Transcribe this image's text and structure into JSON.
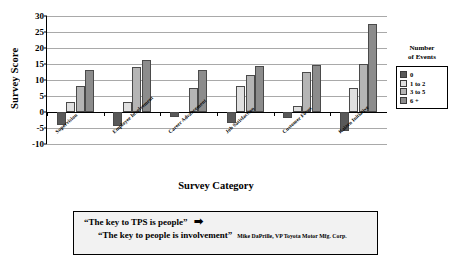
{
  "chart_data": {
    "type": "bar",
    "title": "",
    "xlabel": "Survey Category",
    "ylabel": "Survey Score",
    "ylim": [
      -10,
      30
    ],
    "yticks": [
      -10,
      -5,
      0,
      5,
      10,
      15,
      20,
      25,
      30
    ],
    "grid": true,
    "legend_position": "right",
    "legend_title": "Number of Events",
    "categories": [
      "Supervision",
      "Employee Involvement",
      "Career Advancement",
      "Job Satisfaction",
      "Customer Focus",
      "Kaizen Initiative"
    ],
    "series": [
      {
        "name": "0",
        "color": "#595959",
        "values": [
          -4.0,
          -4.5,
          -1.5,
          -3.5,
          -2.0,
          -6.0
        ]
      },
      {
        "name": "1 to 2",
        "color": "#e0e0e0",
        "values": [
          3.0,
          3.0,
          0.0,
          8.0,
          2.0,
          7.5
        ]
      },
      {
        "name": "3 to 5",
        "color": "#b5b5b5",
        "values": [
          8.0,
          14.2,
          7.5,
          11.5,
          12.5,
          15.0
        ]
      },
      {
        "name": "6 +",
        "color": "#8c8c8c",
        "values": [
          13.0,
          16.2,
          13.2,
          14.5,
          14.8,
          27.5
        ]
      }
    ]
  },
  "legend": {
    "title_line1": "Number",
    "title_line2": "of Events",
    "items": [
      {
        "label": "0"
      },
      {
        "label": "1 to 2"
      },
      {
        "label": "3 to 5"
      },
      {
        "label": "6 +"
      }
    ]
  },
  "quote": {
    "line1": "“The key to TPS is people”",
    "arrow": "➡",
    "line2": "“The key to people is involvement”",
    "attribution": "Mike DaPrille, VP Toyota Motor Mfg. Corp."
  }
}
